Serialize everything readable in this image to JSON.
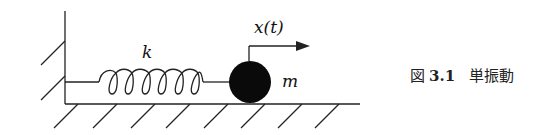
{
  "figure": {
    "labels": {
      "spring_constant": "k",
      "displacement": "x(t)",
      "mass": "m"
    },
    "caption": {
      "prefix": "図",
      "number": "3.1",
      "title": "単振動"
    },
    "colors": {
      "line": "#222222",
      "mass_fill": "#0a0a0a",
      "background": "#ffffff"
    }
  }
}
